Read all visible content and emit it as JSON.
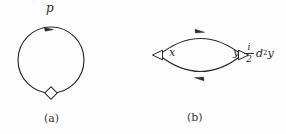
{
  "figure": {
    "background_color": "#fdfdfd",
    "ink_color": "#2a2a2a",
    "panels": [
      {
        "id": "a",
        "caption": "(a)",
        "type": "tadpole-loop",
        "description": "single closed circular propagator loop with one vertex",
        "momentum_label": "p",
        "vertex_glyph": "diamond",
        "arrow_direction": "clockwise-at-top",
        "loop": {
          "center_x": 51,
          "center_y": 60,
          "radius": 33
        }
      },
      {
        "id": "b",
        "caption": "(b)",
        "type": "bubble-loop",
        "description": "two-point bubble diagram with two vertices joined by two propagators",
        "left_vertex_label": "x",
        "right_vertex_label": "y",
        "left_vertex_glyph": "triangle",
        "right_vertex_glyph": "triangle",
        "top_arrow_direction": "right",
        "bottom_arrow_direction": "left",
        "vertex_factor": {
          "fraction_numerator": "i",
          "fraction_denominator": "2",
          "operator": "d",
          "exponent": "2",
          "field": "y",
          "plain_text": "i/2 d^2 y"
        },
        "lens": {
          "left_x": 15,
          "right_x": 100,
          "center_y": 55,
          "bulge": 25
        }
      }
    ]
  }
}
